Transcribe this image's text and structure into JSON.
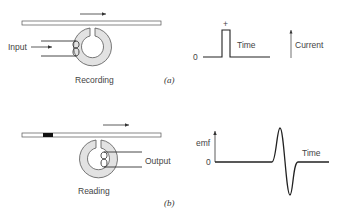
{
  "panel_a": {
    "label": "(a)",
    "head_caption": "Recording",
    "input_label": "Input",
    "graph": {
      "zero_label": "0",
      "plus_label": "+",
      "time_label": "Time",
      "current_label": "Current"
    }
  },
  "panel_b": {
    "label": "(b)",
    "head_caption": "Reading",
    "output_label": "Output",
    "graph": {
      "y_label": "emf",
      "zero_label": "0",
      "time_label": "Time"
    }
  },
  "colors": {
    "line": "#333333",
    "ring_fill": "#e2e2e2",
    "tape_fill": "#ffffff",
    "magnetized_block": "#111111",
    "text": "#444444"
  }
}
